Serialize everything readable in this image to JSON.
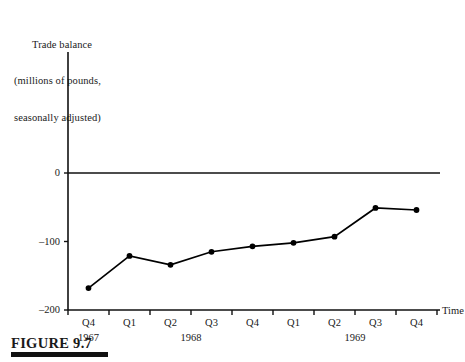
{
  "figure": {
    "caption": "FIGURE 9.7",
    "axis_title_lines": [
      "Trade balance",
      "(millions of pounds,",
      "seasonally adjusted)"
    ],
    "time_axis_label": "Time"
  },
  "chart_data": {
    "type": "line",
    "title": "Trade balance (millions of pounds, seasonally adjusted)",
    "xlabel": "Time",
    "ylabel": "Trade balance (millions of pounds, seasonally adjusted)",
    "ylim": [
      -200,
      0
    ],
    "yticks": [
      0,
      -100,
      -200
    ],
    "ytick_labels": [
      "0",
      "–100",
      "–200"
    ],
    "grid": false,
    "legend": "none",
    "marker": "filled-circle",
    "categories": [
      "Q4",
      "Q1",
      "Q2",
      "Q3",
      "Q4",
      "Q1",
      "Q2",
      "Q3",
      "Q4"
    ],
    "year_groups": [
      {
        "label": "1967",
        "span": 1
      },
      {
        "label": "1968",
        "span": 4
      },
      {
        "label": "1969",
        "span": 4
      }
    ],
    "points": [
      {
        "period": "1967 Q4",
        "value": -168
      },
      {
        "period": "1968 Q1",
        "value": -121
      },
      {
        "period": "1968 Q2",
        "value": -134
      },
      {
        "period": "1968 Q3",
        "value": -115
      },
      {
        "period": "1968 Q4",
        "value": -107
      },
      {
        "period": "1969 Q1",
        "value": -102
      },
      {
        "period": "1969 Q2",
        "value": -93
      },
      {
        "period": "1969 Q3",
        "value": -51
      },
      {
        "period": "1969 Q4",
        "value": -54
      }
    ],
    "values": [
      -168,
      -121,
      -134,
      -115,
      -107,
      -102,
      -93,
      -51,
      -54
    ],
    "zero_line": 0,
    "series_color": "#000000"
  }
}
